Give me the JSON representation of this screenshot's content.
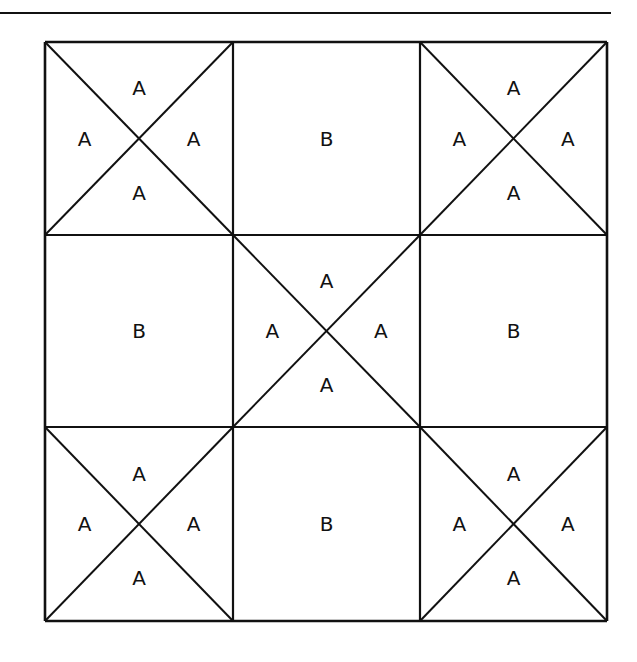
{
  "diagram": {
    "type": "quilt-block",
    "grid": {
      "rows": 3,
      "cols": 3
    },
    "line_color": "#111111",
    "background": "#ffffff",
    "top_rule": {
      "x1": 0,
      "x2": 611,
      "y": 13
    },
    "grid_lines": {
      "x": [
        45,
        233,
        420,
        607
      ],
      "y": [
        42,
        235,
        427,
        621
      ]
    },
    "cells": [
      {
        "row": 0,
        "col": 0,
        "kind": "hourglass",
        "labels": {
          "top": "A",
          "left": "A",
          "right": "A",
          "bottom": "A"
        }
      },
      {
        "row": 0,
        "col": 1,
        "kind": "plain",
        "labels": {
          "center": "B"
        }
      },
      {
        "row": 0,
        "col": 2,
        "kind": "hourglass",
        "labels": {
          "top": "A",
          "left": "A",
          "right": "A",
          "bottom": "A"
        }
      },
      {
        "row": 1,
        "col": 0,
        "kind": "plain",
        "labels": {
          "center": "B"
        }
      },
      {
        "row": 1,
        "col": 1,
        "kind": "hourglass",
        "labels": {
          "top": "A",
          "left": "A",
          "right": "A",
          "bottom": "A"
        }
      },
      {
        "row": 1,
        "col": 2,
        "kind": "plain",
        "labels": {
          "center": "B"
        }
      },
      {
        "row": 2,
        "col": 0,
        "kind": "hourglass",
        "labels": {
          "top": "A",
          "left": "A",
          "right": "A",
          "bottom": "A"
        }
      },
      {
        "row": 2,
        "col": 1,
        "kind": "plain",
        "labels": {
          "center": "B"
        }
      },
      {
        "row": 2,
        "col": 2,
        "kind": "hourglass",
        "labels": {
          "top": "A",
          "left": "A",
          "right": "A",
          "bottom": "A"
        }
      }
    ]
  }
}
